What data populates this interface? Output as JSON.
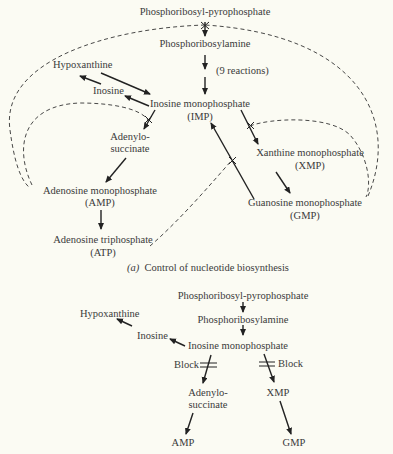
{
  "panel_a": {
    "nodes": {
      "prpp": "Phosphoribosyl-pyrophosphate",
      "pra": "Phosphoribosylamine",
      "nine_reactions": "(9 reactions)",
      "hypoxanthine": "Hypoxanthine",
      "inosine": "Inosine",
      "imp": "Inosine monophosphate",
      "imp_abbr": "(IMP)",
      "adenylo_1": "Adenylo-",
      "adenylo_2": "succinate",
      "amp": "Adenosine monophosphate",
      "amp_abbr": "(AMP)",
      "atp": "Adenosine triphosphate",
      "atp_abbr": "(ATP)",
      "xmp": "Xanthine monophosphate",
      "xmp_abbr": "(XMP)",
      "gmp": "Guanosine monophosphate",
      "gmp_abbr": "(GMP)"
    },
    "caption_label": "(a)",
    "caption": "Control of nucleotide biosynthesis",
    "edges": [
      {
        "from": "Phosphoribosyl-pyrophosphate",
        "to": "Phosphoribosylamine",
        "inhibited_by": [
          "AMP",
          "GMP"
        ]
      },
      {
        "from": "Phosphoribosylamine",
        "to": "Inosine monophosphate",
        "label": "(9 reactions)"
      },
      {
        "from": "Hypoxanthine",
        "to": "Inosine monophosphate"
      },
      {
        "from": "Inosine monophosphate",
        "to": "Inosine"
      },
      {
        "from": "Inosine",
        "to": "Hypoxanthine"
      },
      {
        "from": "Inosine monophosphate",
        "to": "Adenylosuccinate",
        "inhibited_by": [
          "AMP"
        ]
      },
      {
        "from": "Adenylosuccinate",
        "to": "Adenosine monophosphate"
      },
      {
        "from": "Adenosine monophosphate",
        "to": "Adenosine triphosphate"
      },
      {
        "from": "Inosine monophosphate",
        "to": "Xanthine monophosphate",
        "inhibited_by": [
          "GMP"
        ]
      },
      {
        "from": "Xanthine monophosphate",
        "to": "Guanosine monophosphate"
      },
      {
        "from": "Guanosine monophosphate",
        "to": "Inosine monophosphate",
        "inhibited_by": [
          "ATP"
        ]
      }
    ]
  },
  "panel_b": {
    "nodes": {
      "prpp": "Phosphoribosyl-pyrophosphate",
      "pra": "Phosphoribosylamine",
      "hypoxanthine": "Hypoxanthine",
      "inosine": "Inosine",
      "imp": "Inosine monophosphate",
      "block_left": "Block",
      "block_right": "Block",
      "adenylo_1": "Adenylo-",
      "adenylo_2": "succinate",
      "xmp": "XMP",
      "amp": "AMP",
      "gmp": "GMP"
    }
  },
  "colors": {
    "background": "#fbfbf3",
    "ink": "#2a2a2a"
  }
}
